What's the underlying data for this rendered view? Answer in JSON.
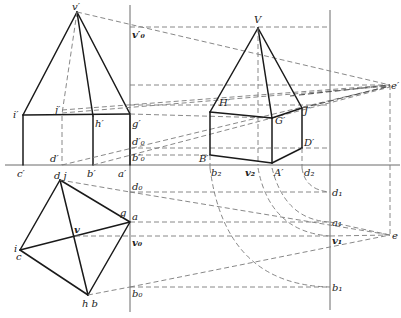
{
  "figure": {
    "labels": {
      "v_prime": "v′",
      "v0_prime": "v′₀",
      "i_prime": "i′",
      "j_prime": "j′",
      "h_prime": "h′",
      "g_prime": "g′",
      "d0_prime": "d′₀",
      "b0_prime": "b′₀",
      "c_prime": "c′",
      "d_prime": "d′",
      "b_prime": "b′",
      "a_prime": "a′",
      "V": "V",
      "H_prime": "H′",
      "G_prime": "G′",
      "J_prime": "J′",
      "D_prime": "D′",
      "B_prime": "B′",
      "A_prime": "A′",
      "b2": "b₂",
      "v2": "v₂",
      "d2": "d₂",
      "e_prime": "e′",
      "e": "e",
      "dj": "d j",
      "g": "g",
      "a": "a",
      "v": "v",
      "i": "i",
      "c": "c",
      "hb": "h b",
      "d0": "d₀",
      "v0": "v₀",
      "b0": "b₀",
      "d1": "d₁",
      "a1": "a₁",
      "v1": "v₁",
      "b1": "b₁"
    }
  }
}
